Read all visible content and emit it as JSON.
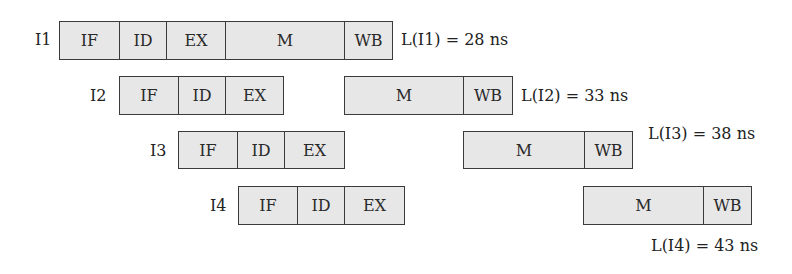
{
  "diagram": {
    "type": "pipeline-timing",
    "fill_color": "#e7e7e7",
    "border_color": "#3a3a3a",
    "instructions": [
      {
        "label": "I1",
        "latency": "L(I1) = 28 ns",
        "stages": [
          {
            "name": "IF",
            "x": 59,
            "w": 60
          },
          {
            "name": "ID",
            "x": 119,
            "w": 47
          },
          {
            "name": "EX",
            "x": 166,
            "w": 59
          },
          {
            "name": "M",
            "x": 225,
            "w": 119
          },
          {
            "name": "WB",
            "x": 344,
            "w": 48
          }
        ]
      },
      {
        "label": "I2",
        "latency": "L(I2) = 33 ns",
        "stages": [
          {
            "name": "IF",
            "x": 119,
            "w": 59
          },
          {
            "name": "ID",
            "x": 178,
            "w": 47
          },
          {
            "name": "EX",
            "x": 225,
            "w": 58
          },
          {
            "name": "M",
            "x": 344,
            "w": 119
          },
          {
            "name": "WB",
            "x": 463,
            "w": 49
          }
        ]
      },
      {
        "label": "I3",
        "latency": "L(I3) = 38 ns",
        "stages": [
          {
            "name": "IF",
            "x": 178,
            "w": 59
          },
          {
            "name": "ID",
            "x": 237,
            "w": 47
          },
          {
            "name": "EX",
            "x": 284,
            "w": 60
          },
          {
            "name": "M",
            "x": 463,
            "w": 121
          },
          {
            "name": "WB",
            "x": 584,
            "w": 48
          }
        ]
      },
      {
        "label": "I4",
        "latency": "L(I4) = 43 ns",
        "stages": [
          {
            "name": "IF",
            "x": 238,
            "w": 59
          },
          {
            "name": "ID",
            "x": 297,
            "w": 47
          },
          {
            "name": "EX",
            "x": 344,
            "w": 60
          },
          {
            "name": "M",
            "x": 583,
            "w": 120
          },
          {
            "name": "WB",
            "x": 703,
            "w": 48
          }
        ]
      }
    ]
  }
}
